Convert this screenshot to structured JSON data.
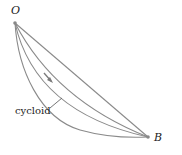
{
  "diagram": {
    "points": {
      "O": {
        "label": "O",
        "x": 15,
        "y": 23
      },
      "B": {
        "label": "B",
        "x": 148,
        "y": 137
      }
    },
    "curve_label": "cycloid",
    "curves": [
      "straight line",
      "shallow curve",
      "medium curve",
      "cycloid"
    ],
    "colors": {
      "curve": "#8a8a8a",
      "arrow": "#7a7a7a",
      "text": "#222222"
    }
  }
}
